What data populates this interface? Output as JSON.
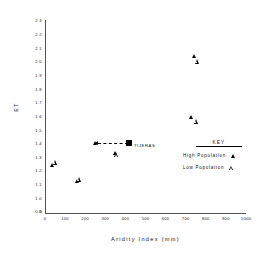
{
  "chart_data": {
    "type": "scatter",
    "title": "",
    "xlabel": "Aridity Index (mm)",
    "ylabel": "ET",
    "xlim": [
      0,
      1000
    ],
    "ylim": [
      0.9,
      2.3
    ],
    "grid": false,
    "xticks": [
      "0",
      "100",
      "200",
      "300",
      "400",
      "500",
      "600",
      "700",
      "800",
      "900",
      "1000"
    ],
    "xtick_values": [
      0,
      100,
      200,
      300,
      400,
      500,
      600,
      700,
      800,
      900,
      1000
    ],
    "yticks": [
      "2.3",
      "2.2",
      "2.1",
      "2.0",
      "1.9",
      "1.8",
      "1.7",
      "1.6",
      "1.5",
      "1.4",
      "1.3",
      "1.2",
      "1.1",
      "1.0",
      "0.9"
    ],
    "ytick_values": [
      2.3,
      2.2,
      2.1,
      2.0,
      1.9,
      1.8,
      1.7,
      1.6,
      1.5,
      1.4,
      1.3,
      1.2,
      1.1,
      1.0,
      0.9
    ],
    "y_origin_label": "0",
    "legend": {
      "title": "KEY",
      "position": "right-middle",
      "entries": [
        {
          "label": "High Population",
          "marker": "filled-triangle"
        },
        {
          "label": "Low Population",
          "marker": "open-triangle"
        }
      ]
    },
    "series": [
      {
        "name": "High Population",
        "marker": "filled-triangle",
        "points": [
          {
            "x": 40,
            "y": 1.25
          },
          {
            "x": 160,
            "y": 1.13
          },
          {
            "x": 250,
            "y": 1.41
          },
          {
            "x": 350,
            "y": 1.34
          },
          {
            "x": 730,
            "y": 1.6
          },
          {
            "x": 745,
            "y": 2.05
          }
        ]
      },
      {
        "name": "Low Population",
        "marker": "open-triangle",
        "points": [
          {
            "x": 55,
            "y": 1.27
          },
          {
            "x": 175,
            "y": 1.16
          },
          {
            "x": 360,
            "y": 1.36
          },
          {
            "x": 755,
            "y": 1.62
          },
          {
            "x": 760,
            "y": 2.08
          }
        ]
      },
      {
        "name": "TIJERAS",
        "marker": "filled-square",
        "points": [
          {
            "x": 420,
            "y": 1.41
          }
        ]
      }
    ],
    "annotations": [
      {
        "type": "point-label",
        "text": "TIJERAS",
        "x": 420,
        "y": 1.41
      },
      {
        "type": "arrow",
        "from_x": 420,
        "from_y": 1.41,
        "to_x": 250,
        "to_y": 1.41,
        "style": "dashed",
        "direction": "left"
      }
    ]
  }
}
